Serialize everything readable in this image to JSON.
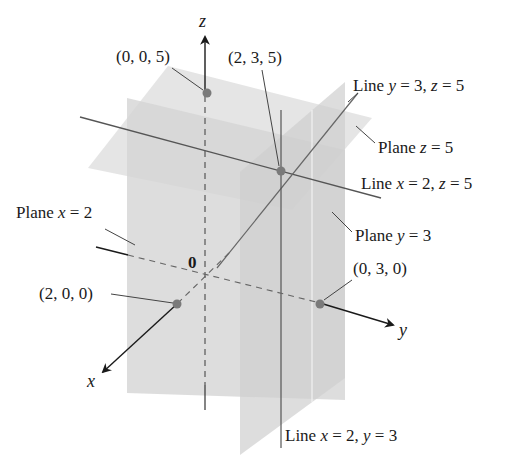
{
  "figure": {
    "type": "3D coordinate diagram",
    "colors": {
      "plane_fill": "#d9d9d9",
      "plane_fill_dark": "#cdcdcd",
      "line": "#555555",
      "axis": "#1a1a1a",
      "point": "#777777",
      "text": "#1a1a1a"
    },
    "axes": {
      "x": "x",
      "y": "y",
      "z": "z",
      "origin": "0"
    },
    "points": [
      {
        "label": "(0, 0, 5)",
        "coords": [
          0,
          0,
          5
        ]
      },
      {
        "label": "(2, 3, 5)",
        "coords": [
          2,
          3,
          5
        ]
      },
      {
        "label": "(2, 0, 0)",
        "coords": [
          2,
          0,
          0
        ]
      },
      {
        "label": "(0, 3, 0)",
        "coords": [
          0,
          3,
          0
        ]
      }
    ],
    "planes": [
      {
        "label_prefix": "Plane ",
        "var": "x",
        "eq": " = 2"
      },
      {
        "label_prefix": "Plane ",
        "var": "y",
        "eq": " = 3"
      },
      {
        "label_prefix": "Plane ",
        "var": "z",
        "eq": " = 5"
      }
    ],
    "lines": [
      {
        "prefix": "Line ",
        "v1": "y",
        "e1": " = 3, ",
        "v2": "z",
        "e2": " = 5"
      },
      {
        "prefix": "Line ",
        "v1": "x",
        "e1": " = 2, ",
        "v2": "z",
        "e2": " = 5"
      },
      {
        "prefix": "Line ",
        "v1": "x",
        "e1": " = 2, ",
        "v2": "y",
        "e2": " = 3"
      }
    ]
  }
}
